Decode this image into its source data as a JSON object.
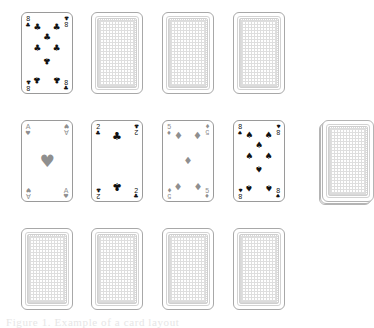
{
  "canvas": {
    "width": 357,
    "height": 325,
    "background": "#ffffff"
  },
  "caption": {
    "text": "Figure 1. Example of a card layout"
  },
  "suits": {
    "clubs": {
      "glyph": "♣",
      "color": "#111111",
      "name": "clubs"
    },
    "spades": {
      "glyph": "♠",
      "color": "#111111",
      "name": "spades"
    },
    "hearts": {
      "glyph": "♥",
      "color": "#8f8f8f",
      "name": "hearts"
    },
    "diamonds": {
      "glyph": "♦",
      "color": "#8f8f8f",
      "name": "diamonds"
    }
  },
  "card_back": {
    "pattern": "dotted-checker",
    "border_color": "#a8a8a8",
    "frame_color": "#d2d2d2",
    "fill_color": "#dedede"
  },
  "rows": [
    {
      "label": "row-1",
      "y": 12,
      "cards": [
        {
          "slot": 1,
          "x": 21,
          "face_up": true,
          "rank": "8",
          "suit": "clubs",
          "label": "8 of Clubs"
        },
        {
          "slot": 2,
          "x": 91,
          "face_up": false,
          "label": "Face-down card"
        },
        {
          "slot": 3,
          "x": 162,
          "face_up": false,
          "label": "Face-down card"
        },
        {
          "slot": 4,
          "x": 233,
          "face_up": false,
          "label": "Face-down card"
        }
      ]
    },
    {
      "label": "row-2",
      "y": 120,
      "cards": [
        {
          "slot": 1,
          "x": 21,
          "face_up": true,
          "rank": "A",
          "suit": "hearts",
          "label": "Ace of Hearts"
        },
        {
          "slot": 2,
          "x": 91,
          "face_up": true,
          "rank": "2",
          "suit": "clubs",
          "label": "2 of Clubs"
        },
        {
          "slot": 3,
          "x": 162,
          "face_up": true,
          "rank": "5",
          "suit": "diamonds",
          "label": "5 of Diamonds"
        },
        {
          "slot": 4,
          "x": 233,
          "face_up": true,
          "rank": "8",
          "suit": "spades",
          "label": "8 of Spades"
        }
      ]
    },
    {
      "label": "row-3",
      "y": 228,
      "cards": [
        {
          "slot": 1,
          "x": 21,
          "face_up": false,
          "label": "Face-down card"
        },
        {
          "slot": 2,
          "x": 91,
          "face_up": false,
          "label": "Face-down card"
        },
        {
          "slot": 3,
          "x": 162,
          "face_up": false,
          "label": "Face-down card"
        },
        {
          "slot": 4,
          "x": 233,
          "face_up": false,
          "label": "Face-down card"
        }
      ]
    }
  ],
  "deck": {
    "label": "Draw deck",
    "x": 322,
    "y": 120,
    "layers": 3,
    "face_up": false
  },
  "pip_layouts": {
    "A": [
      [
        50,
        50
      ]
    ],
    "2": [
      [
        50,
        12
      ],
      [
        50,
        88
      ]
    ],
    "5": [
      [
        20,
        12
      ],
      [
        80,
        12
      ],
      [
        50,
        50
      ],
      [
        20,
        88
      ],
      [
        80,
        88
      ]
    ],
    "8": [
      [
        20,
        10
      ],
      [
        80,
        10
      ],
      [
        50,
        26
      ],
      [
        20,
        42
      ],
      [
        80,
        42
      ],
      [
        50,
        60
      ],
      [
        20,
        90
      ],
      [
        80,
        90
      ]
    ]
  },
  "pip_sizes": {
    "A": 17,
    "2": 11,
    "5": 10,
    "8": 9
  }
}
